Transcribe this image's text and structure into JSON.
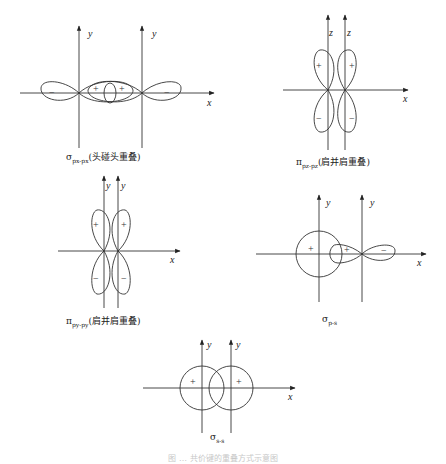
{
  "panels": [
    {
      "id": "sigma-pp",
      "axis_labels": {
        "vertical_left": "y",
        "vertical_right": "y",
        "horizontal": "x"
      },
      "signs": [
        "−",
        "+",
        "+",
        "−"
      ],
      "caption_symbol": "σ",
      "caption_sub": "px-px",
      "caption_text": "(头碰头重叠)"
    },
    {
      "id": "pi-pz",
      "axis_labels": {
        "vertical_left": "z",
        "vertical_right": "z",
        "horizontal": "x"
      },
      "signs": [
        "+",
        "+",
        "−",
        "−"
      ],
      "caption_symbol": "π",
      "caption_sub": "pz-pz",
      "caption_text": "(肩并肩重叠)"
    },
    {
      "id": "pi-py",
      "axis_labels": {
        "vertical_left": "y",
        "vertical_right": "y",
        "horizontal": "x"
      },
      "signs": [
        "+",
        "+",
        "−",
        "−"
      ],
      "caption_symbol": "π",
      "caption_sub": "py-py",
      "caption_text": "(肩并肩重叠)"
    },
    {
      "id": "sigma-ps",
      "axis_labels": {
        "vertical_left": "y",
        "vertical_right": "y",
        "horizontal": "x"
      },
      "signs": [
        "+",
        "+",
        "−"
      ],
      "caption_symbol": "σ",
      "caption_sub": "p-s",
      "caption_text": ""
    },
    {
      "id": "sigma-ss",
      "axis_labels": {
        "vertical_left": "y",
        "vertical_right": "y",
        "horizontal": "x"
      },
      "signs": [
        "+",
        "+"
      ],
      "caption_symbol": "σ",
      "caption_sub": "s-s",
      "caption_text": ""
    }
  ],
  "figure_caption": "图 … 共价键的重叠方式示意图"
}
